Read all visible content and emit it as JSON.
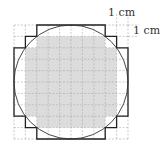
{
  "diagram": {
    "labels": {
      "horizontal_unit": "1 cm",
      "vertical_unit": "1 cm"
    },
    "grid": {
      "cells": 10,
      "cell_size_px": 11.4,
      "origin_px": [
        14,
        25
      ]
    },
    "circle": {
      "center_px": [
        71,
        82
      ],
      "radius_px": 57
    },
    "colors": {
      "grid": "#aaaaaa",
      "shading": "#dddddd",
      "outline": "#222222"
    }
  }
}
